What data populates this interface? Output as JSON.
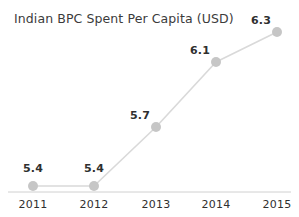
{
  "chart_data": {
    "type": "line",
    "title": "Indian BPC Spent Per Capita (USD)",
    "xlabel": "",
    "ylabel": "",
    "categories": [
      "2011",
      "2012",
      "2013",
      "2014",
      "2015"
    ],
    "values": [
      5.4,
      5.4,
      5.7,
      6.1,
      6.3
    ],
    "value_labels": [
      "5.4",
      "5.4",
      "5.7",
      "6.1",
      "6.3"
    ],
    "series": [
      {
        "name": "Indian BPC Spent Per Capita (USD)",
        "values": [
          5.4,
          5.4,
          5.7,
          6.1,
          6.3
        ]
      }
    ],
    "ylim": [
      5.3,
      6.35
    ],
    "grid": false,
    "legend": false,
    "legend_position": "none",
    "colors": {
      "line": "#d9d9d9",
      "marker": "#c6c6c6",
      "axis": "#d0d0d0",
      "title_text": "#3b3b3b",
      "label_text": "#2f2f2f",
      "background": "#ffffff"
    },
    "points": [
      {
        "category": "2011",
        "value": 5.4,
        "label": "5.4",
        "x": 33,
        "y": 186,
        "label_x": 33,
        "label_y": 168
      },
      {
        "category": "2012",
        "value": 5.4,
        "label": "5.4",
        "x": 94,
        "y": 186,
        "label_x": 94,
        "label_y": 168
      },
      {
        "category": "2013",
        "value": 5.7,
        "label": "5.7",
        "x": 156,
        "y": 127,
        "label_x": 140,
        "label_y": 115
      },
      {
        "category": "2014",
        "value": 6.1,
        "label": "6.1",
        "x": 216,
        "y": 62,
        "label_x": 200,
        "label_y": 50
      },
      {
        "category": "2015",
        "value": 6.3,
        "label": "6.3",
        "x": 277,
        "y": 32,
        "label_x": 261,
        "label_y": 20
      }
    ],
    "axis": {
      "x_start": 8,
      "x_end": 291,
      "y": 192,
      "tick_label_y": 198
    }
  }
}
